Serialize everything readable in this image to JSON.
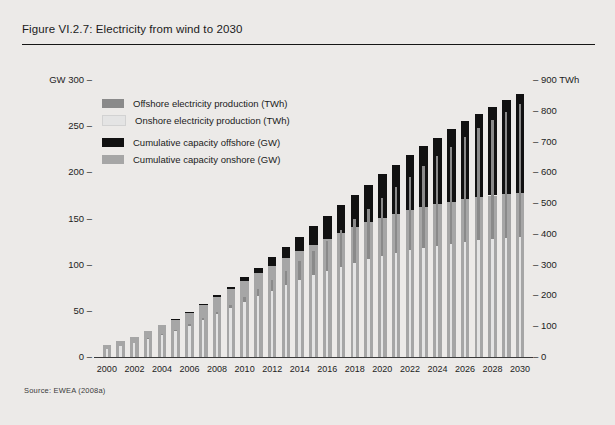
{
  "figure": {
    "title": "Figure VI.2.7: Electricity from wind to 2030",
    "source": "Source: EWEA (2008a)"
  },
  "legend": {
    "items": [
      {
        "label": "Offshore electricity production (TWh)",
        "color": "#8a8a8a"
      },
      {
        "label": "Onshore electricity production (TWh)",
        "color": "#e4e4e4"
      },
      {
        "label": "Cumulative capacity offshore (GW)",
        "color": "#111111"
      },
      {
        "label": "Cumulative capacity onshore (GW)",
        "color": "#a6a6a6"
      }
    ]
  },
  "chart_data": {
    "type": "bar",
    "title": "Electricity from wind to 2030",
    "xlabel": "",
    "ylabel": "GW",
    "y2label": "TWh",
    "ylim": [
      0,
      300
    ],
    "y2lim": [
      0,
      900
    ],
    "grid": false,
    "legend_position": "top-left",
    "left_axis_unit": "GW",
    "right_axis_unit": "TWh",
    "left_ticks": [
      0,
      50,
      100,
      150,
      200,
      250,
      300
    ],
    "right_ticks": [
      0,
      100,
      200,
      300,
      400,
      500,
      600,
      700,
      800,
      900
    ],
    "categories": [
      "2000",
      "2001",
      "2002",
      "2003",
      "2004",
      "2005",
      "2006",
      "2007",
      "2008",
      "2009",
      "2010",
      "2011",
      "2012",
      "2013",
      "2014",
      "2015",
      "2016",
      "2017",
      "2018",
      "2019",
      "2020",
      "2021",
      "2022",
      "2023",
      "2024",
      "2025",
      "2026",
      "2027",
      "2028",
      "2029",
      "2030"
    ],
    "xtick_labels": [
      "2000",
      "2002",
      "2004",
      "2006",
      "2008",
      "2010",
      "2012",
      "2014",
      "2016",
      "2018",
      "2020",
      "2022",
      "2024",
      "2026",
      "2028",
      "2030"
    ],
    "series": [
      {
        "name": "Cumulative capacity onshore (GW)",
        "unit": "GW",
        "axis": "left",
        "color": "#a6a6a6",
        "values": [
          12.9,
          17.3,
          21.3,
          28.5,
          34.4,
          40.5,
          48.0,
          56.5,
          64.9,
          73.5,
          82.0,
          90.6,
          99.0,
          107.0,
          114.5,
          121.6,
          128.3,
          134.6,
          140.4,
          145.8,
          150.8,
          155.2,
          159.0,
          162.5,
          165.6,
          168.4,
          170.8,
          173.0,
          174.9,
          176.5,
          178.0
        ]
      },
      {
        "name": "Cumulative capacity offshore (GW)",
        "unit": "GW",
        "axis": "left",
        "color": "#111111",
        "values": [
          0.0,
          0.1,
          0.2,
          0.5,
          0.6,
          0.7,
          0.9,
          1.2,
          1.8,
          2.8,
          4.2,
          6.2,
          8.8,
          12.0,
          15.7,
          19.9,
          24.6,
          29.7,
          35.2,
          41.0,
          47.0,
          53.2,
          59.5,
          65.8,
          72.1,
          78.3,
          84.4,
          90.4,
          96.2,
          101.8,
          107.0
        ]
      },
      {
        "name": "Onshore electricity production (TWh)",
        "unit": "TWh",
        "axis": "right",
        "color": "#e4e4e4",
        "values": [
          26,
          36,
          45,
          60,
          73,
          86,
          102,
          121,
          140,
          159,
          178,
          197,
          215,
          233,
          249,
          265,
          279,
          293,
          305,
          317,
          328,
          338,
          347,
          355,
          362,
          368,
          374,
          379,
          383,
          387,
          390
        ]
      },
      {
        "name": "Offshore electricity production (TWh)",
        "unit": "TWh",
        "axis": "right",
        "color": "#8a8a8a",
        "values": [
          0,
          0,
          1,
          2,
          2,
          3,
          4,
          5,
          7,
          11,
          17,
          25,
          35,
          48,
          63,
          80,
          99,
          120,
          142,
          165,
          189,
          214,
          239,
          265,
          290,
          315,
          340,
          364,
          387,
          410,
          432
        ]
      }
    ]
  }
}
